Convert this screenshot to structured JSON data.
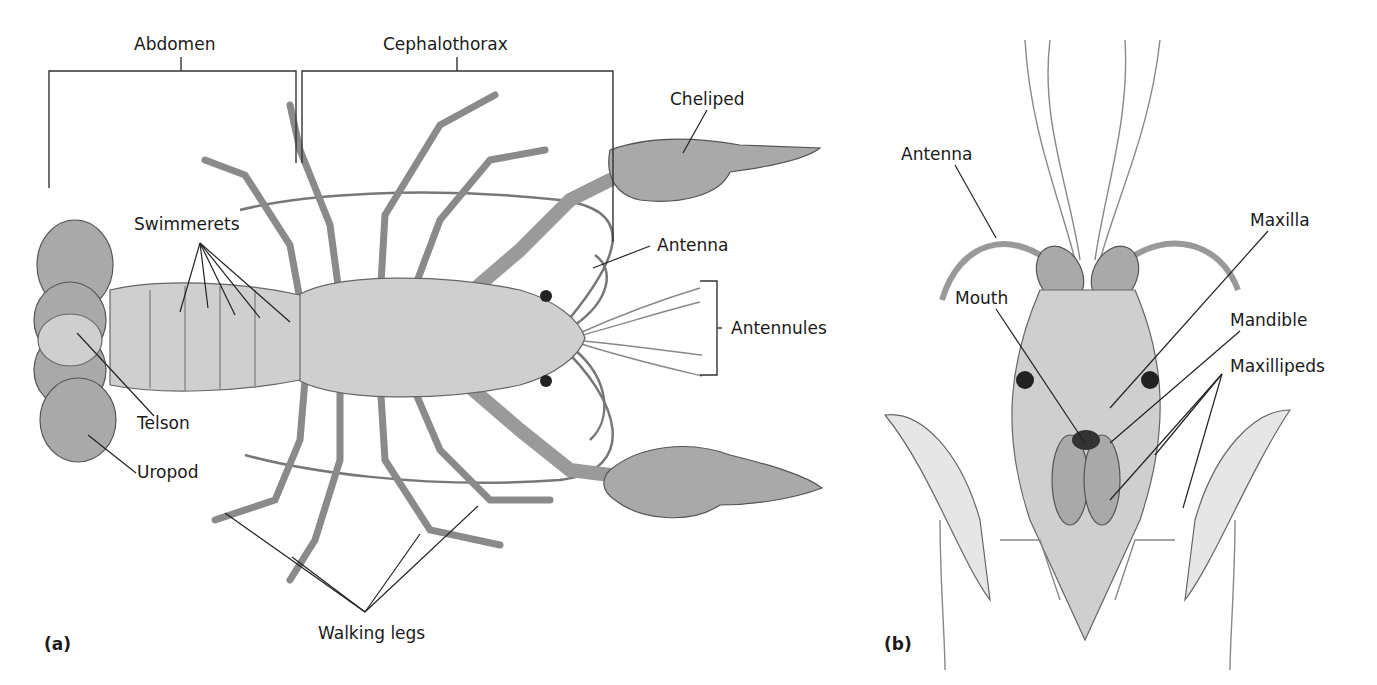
{
  "figure": {
    "panels": [
      {
        "id": "a",
        "label": "(a)",
        "view": "Ventral view of whole crayfish"
      },
      {
        "id": "b",
        "label": "(b)",
        "view": "Ventral view of head and mouthparts"
      }
    ]
  },
  "panel_a": {
    "label": "(a)",
    "regions": {
      "abdomen": "Abdomen",
      "cephalothorax": "Cephalothorax"
    },
    "labels": {
      "cheliped": "Cheliped",
      "antenna": "Antenna",
      "antennules": "Antennules",
      "swimmerets": "Swimmerets",
      "telson": "Telson",
      "uropod": "Uropod",
      "walking_legs": "Walking legs"
    }
  },
  "panel_b": {
    "label": "(b)",
    "labels": {
      "antenna": "Antenna",
      "maxilla": "Maxilla",
      "mouth": "Mouth",
      "mandible": "Mandible",
      "maxillipeds": "Maxillipeds"
    }
  },
  "colors": {
    "background": "#ffffff",
    "label_text": "#1a1a1a",
    "leader_lines": "#222222",
    "illustration_gray": "#b0b0b0"
  }
}
